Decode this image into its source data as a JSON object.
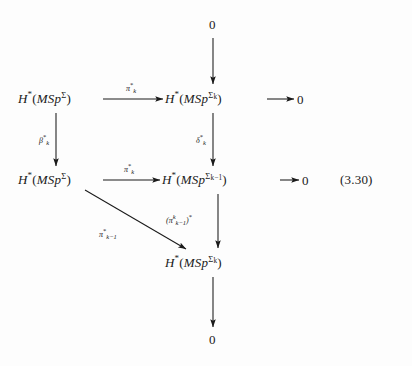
{
  "figure": {
    "equation_number": "(3.30)",
    "background_color": "#fdfdfd",
    "ink_color": "#1a1a1a"
  },
  "nodes": {
    "top_zero": "0",
    "bottom_zero": "0",
    "row1_right_zero": "0",
    "row2_right_zero": "0",
    "row1_left": {
      "h": "H",
      "star": "*",
      "open": "(",
      "msp": "MSp",
      "sup": "Σ",
      "close": ")"
    },
    "row1_right": {
      "h": "H",
      "star": "*",
      "open": "(",
      "msp": "MSp",
      "sup": "Σ",
      "sup_sub": "k",
      "close": ")"
    },
    "row2_left": {
      "h": "H",
      "star": "*",
      "open": "(",
      "msp": "MSp",
      "sup": "Σ",
      "close": ")"
    },
    "row2_right": {
      "h": "H",
      "star": "*",
      "open": "(",
      "msp": "MSp",
      "sup": "Σ",
      "sup_sub": "k−1",
      "close": ")"
    },
    "row3_center": {
      "h": "H",
      "star": "*",
      "open": "(",
      "msp": "MSp",
      "sup": "Σ",
      "sup_sub": "k",
      "close": ")"
    }
  },
  "arrow_labels": {
    "pi_k_row1": {
      "base": "π",
      "star": "*",
      "sub": "k"
    },
    "pi_k_row2": {
      "base": "π",
      "star": "*",
      "sub": "k"
    },
    "beta_k": {
      "base": "β",
      "star": "*",
      "sub": "k"
    },
    "delta_k": {
      "base": "δ",
      "star": "*",
      "sub": "k"
    },
    "pi_k_minus_1_diag": {
      "base": "π",
      "star": "*",
      "sub": "k−1"
    },
    "pi_pair": {
      "open": "(",
      "base": "π",
      "power": "k",
      "sub": "k−1",
      "close": ")",
      "star": "*"
    }
  }
}
